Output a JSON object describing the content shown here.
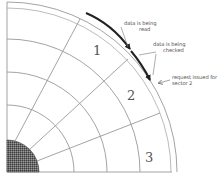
{
  "diagram": {
    "type": "disk-sector-quadrant",
    "sector_labels": [
      "1",
      "2",
      "3"
    ],
    "annotations": {
      "read_line1": "data is being",
      "read_line2": "read",
      "checked_line1": "data is being",
      "checked_line2": "checked",
      "request_line1": "request issued for",
      "request_line2": "sector 2"
    },
    "colors": {
      "lines": "#9a9a9a",
      "arrow": "#222222",
      "hub": "#5a5a5a",
      "text": "#555555"
    }
  }
}
